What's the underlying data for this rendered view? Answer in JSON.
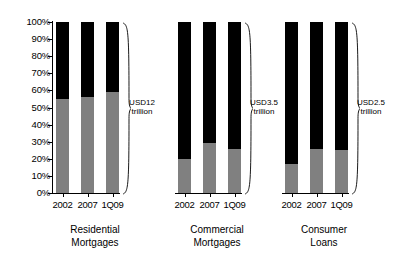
{
  "chart_data": {
    "type": "bar",
    "title": "",
    "subtitle": "",
    "xlabel": "",
    "ylabel": "",
    "ylim": [
      0,
      100
    ],
    "stacked": true,
    "percent_stacked": true,
    "grid": false,
    "legend_position": "none",
    "axis_tick_labels": [
      "100%",
      "90%",
      "80%",
      "70%",
      "60%",
      "50%",
      "40%",
      "30%",
      "20%",
      "10%",
      "0%"
    ],
    "axis_tick_values": [
      100,
      90,
      80,
      70,
      60,
      50,
      40,
      30,
      20,
      10,
      0
    ],
    "categories": [
      "2002",
      "2007",
      "1Q09"
    ],
    "series": [
      {
        "name": "lower-segment",
        "color": "#808080"
      },
      {
        "name": "upper-segment",
        "color": "#000000"
      }
    ],
    "groups": [
      {
        "name": "Residential Mortgages",
        "title_line1": "Residential",
        "title_line2": "Mortgages",
        "annotation_line1": "USD12",
        "annotation_line2": "trillion",
        "bars": [
          {
            "category": "2002",
            "lower": 55,
            "upper": 45
          },
          {
            "category": "2007",
            "lower": 56,
            "upper": 44
          },
          {
            "category": "1Q09",
            "lower": 59,
            "upper": 41
          }
        ]
      },
      {
        "name": "Commercial Mortgages",
        "title_line1": "Commercial",
        "title_line2": "Mortgages",
        "annotation_line1": "USD3.5",
        "annotation_line2": "trillion",
        "bars": [
          {
            "category": "2002",
            "lower": 20,
            "upper": 80
          },
          {
            "category": "2007",
            "lower": 29,
            "upper": 71
          },
          {
            "category": "1Q09",
            "lower": 26,
            "upper": 74
          }
        ]
      },
      {
        "name": "Consumer Loans",
        "title_line1": "Consumer",
        "title_line2": "Loans",
        "annotation_line1": "USD2.5",
        "annotation_line2": "trillion",
        "bars": [
          {
            "category": "2002",
            "lower": 17,
            "upper": 83
          },
          {
            "category": "2007",
            "lower": 26,
            "upper": 74
          },
          {
            "category": "1Q09",
            "lower": 25,
            "upper": 75
          }
        ]
      }
    ]
  }
}
